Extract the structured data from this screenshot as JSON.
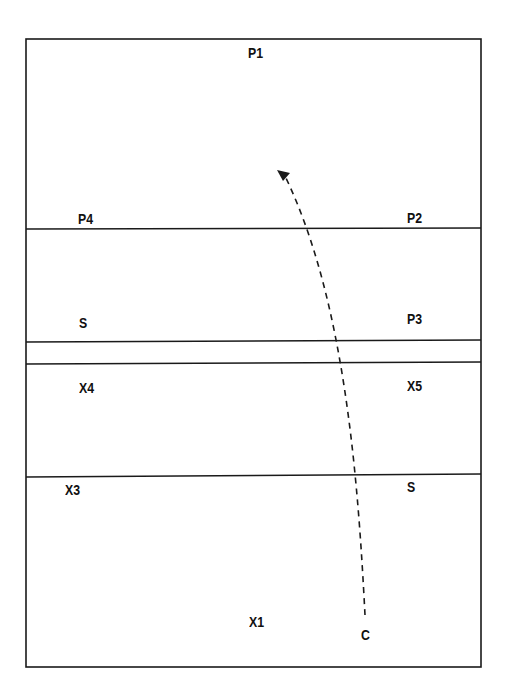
{
  "diagram": {
    "type": "play-diagram",
    "stroke_color": "#1a1a1a",
    "court": {
      "x": 26,
      "y": 39,
      "width": 455,
      "height": 628
    },
    "lines_y": [
      229,
      341,
      363,
      476
    ],
    "labels": {
      "p1": "P1",
      "p4": "P4",
      "p2": "P2",
      "s_left": "S",
      "p3": "P3",
      "x4": "X4",
      "x5": "X5",
      "x3": "X3",
      "s_right": "S",
      "x1": "X1",
      "c": "C"
    },
    "path": {
      "style": "dashed",
      "from": "C",
      "direction": "up-left",
      "d": "M 365 615 C 358 480, 345 300, 285 176"
    }
  }
}
